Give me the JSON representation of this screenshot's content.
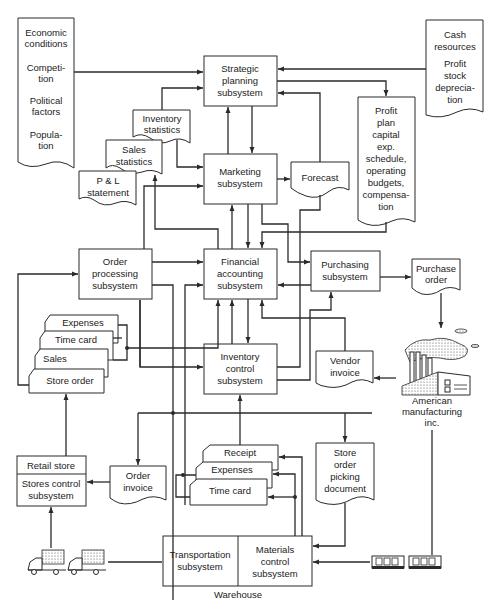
{
  "diagram": {
    "external_doc_left": {
      "lines": [
        "Economic",
        "conditions",
        "Competi-",
        "tion",
        "Political",
        "factors",
        "Popula-",
        "tion"
      ]
    },
    "external_doc_right": {
      "lines": [
        "Cash",
        "resources",
        "Profit",
        "stock",
        "deprecia-",
        "tion"
      ]
    },
    "subsystems": {
      "strategic_planning": [
        "Strategic",
        "planning",
        "subsystem"
      ],
      "marketing": [
        "Marketing",
        "subsystem"
      ],
      "financial_accounting": [
        "Financial",
        "accounting",
        "subsystem"
      ],
      "order_processing": [
        "Order",
        "processing",
        "subsystem"
      ],
      "purchasing": [
        "Purchasing",
        "subsystem"
      ],
      "inventory_control": [
        "Inventory",
        "control",
        "subsystem"
      ],
      "stores_control_header": "Retail store",
      "stores_control": [
        "Stores control",
        "subsystem"
      ],
      "transportation": [
        "Transportation",
        "subsystem"
      ],
      "materials_control": [
        "Materials",
        "control",
        "subsystem"
      ]
    },
    "documents": {
      "inventory_statistics": [
        "Inventory",
        "statistics"
      ],
      "sales_statistics": [
        "Sales",
        "statistics"
      ],
      "pl_statement": [
        "P & L",
        "statement"
      ],
      "forecast": "Forecast",
      "profit_plan": [
        "Profit",
        "plan",
        "capital",
        "exp.",
        "schedule,",
        "operating",
        "budgets,",
        "compensa-",
        "tion"
      ],
      "purchase_order": [
        "Purchase",
        "order"
      ],
      "vendor_invoice": [
        "Vendor",
        "invoice"
      ],
      "order_invoice": [
        "Order",
        "invoice"
      ],
      "store_order_picking": [
        "Store",
        "order",
        "picking",
        "document"
      ]
    },
    "card_stacks": {
      "store_cards": [
        "Expenses",
        "Time card",
        "Sales",
        "Store order"
      ],
      "warehouse_cards": [
        "Receipt",
        "Expenses",
        "Time card"
      ]
    },
    "entities": {
      "manufacturer": [
        "American",
        "manufacturing",
        "inc."
      ],
      "warehouse_label": "Warehouse"
    },
    "icons": {
      "factory": "factory-icon",
      "trucks": "truck-icon",
      "rail_cars": "railcar-icon"
    },
    "colors": {
      "ink": "#2a2a2a",
      "paper": "#ffffff"
    }
  }
}
